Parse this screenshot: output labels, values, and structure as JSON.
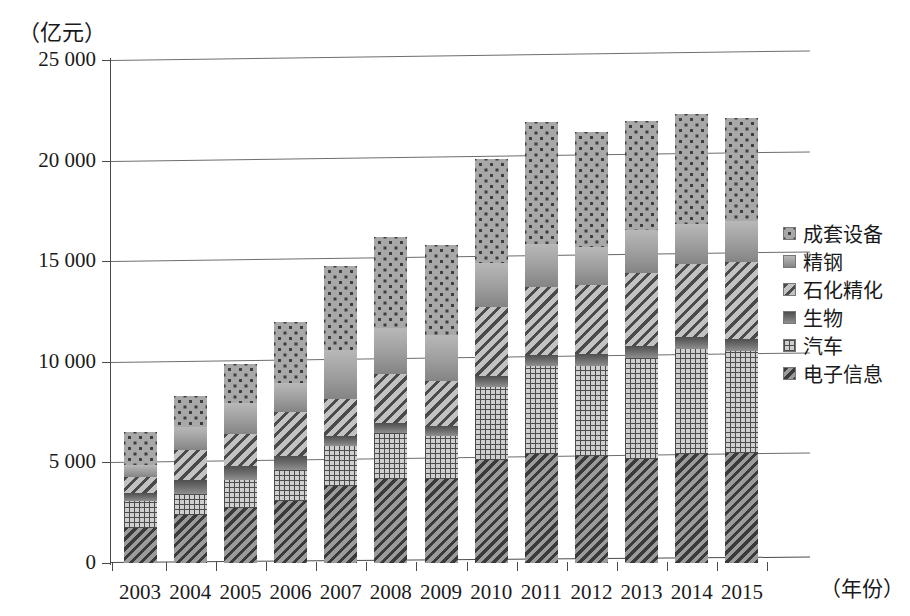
{
  "chart_data": {
    "type": "bar",
    "stacked": true,
    "title": "",
    "subtitle": "",
    "unit_label": "（亿元）",
    "xlabel": "（年份）",
    "ylabel": "",
    "ylim": [
      0,
      25000
    ],
    "ytick_labels": [
      "0",
      "5 000",
      "10 000",
      "15 000",
      "20 000",
      "25 000"
    ],
    "ytick_values": [
      0,
      5000,
      10000,
      15000,
      20000,
      25000
    ],
    "grid": true,
    "legend_position": "right",
    "categories": [
      "2003",
      "2004",
      "2005",
      "2006",
      "2007",
      "2008",
      "2009",
      "2010",
      "2011",
      "2012",
      "2013",
      "2014",
      "2015"
    ],
    "series": [
      {
        "name": "电子信息",
        "pattern": "dark-diagonal-hatch",
        "color": "#6e6e6e",
        "values": [
          1750,
          2400,
          2750,
          3100,
          3850,
          4200,
          4200,
          5100,
          5400,
          5300,
          5150,
          5400,
          5450
        ]
      },
      {
        "name": "汽车",
        "pattern": "dot-grid",
        "color": "#cfcfcf",
        "values": [
          1350,
          1050,
          1400,
          1500,
          1950,
          2250,
          2100,
          3650,
          4400,
          4500,
          5050,
          5250,
          5100
        ]
      },
      {
        "name": "生物",
        "pattern": "solid-dark-gray",
        "color": "#6a6a6a",
        "values": [
          380,
          700,
          650,
          700,
          500,
          500,
          500,
          550,
          550,
          600,
          600,
          600,
          600
        ]
      },
      {
        "name": "石化精化",
        "pattern": "medium-diagonal-hatch",
        "color": "#9a9a9a",
        "values": [
          800,
          1450,
          1600,
          2200,
          1850,
          2450,
          2250,
          3400,
          3350,
          3400,
          3600,
          3600,
          3800
        ]
      },
      {
        "name": "精钢",
        "pattern": "solid-light-gray",
        "color": "#9d9d9d",
        "values": [
          600,
          1150,
          1550,
          1450,
          2450,
          2300,
          2300,
          2200,
          2150,
          1900,
          2150,
          2000,
          2050
        ]
      },
      {
        "name": "成套设备",
        "pattern": "light-dotted",
        "color": "#a8a8a8",
        "values": [
          1620,
          1550,
          1950,
          3050,
          4150,
          4500,
          4450,
          5200,
          6050,
          5700,
          5400,
          5450,
          5100
        ]
      }
    ],
    "totals": [
      6500,
      8300,
      9900,
      12000,
      14750,
      16200,
      15800,
      20100,
      21900,
      21400,
      21950,
      22300,
      22100
    ]
  },
  "legend": {
    "items": [
      {
        "label": "成套设备"
      },
      {
        "label": "精钢"
      },
      {
        "label": "石化精化"
      },
      {
        "label": "生物"
      },
      {
        "label": "汽车"
      },
      {
        "label": "电子信息"
      }
    ]
  }
}
